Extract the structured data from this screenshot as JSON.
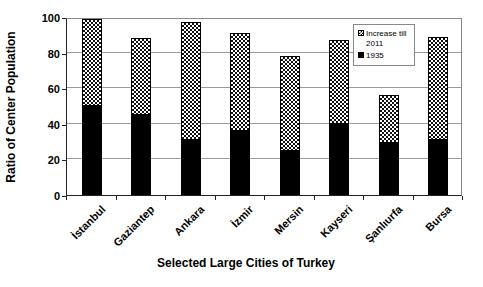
{
  "chart_data": {
    "type": "bar",
    "stacked": true,
    "title": "",
    "xlabel": "Selected Large Cities of Turkey",
    "ylabel": "Ratio of Center Population",
    "ylim": [
      0,
      100
    ],
    "yticks": [
      0,
      20,
      40,
      60,
      80,
      100
    ],
    "grid": true,
    "legend_position": "top-right-inside",
    "categories": [
      "İstanbul",
      "Gaziantep",
      "Ankara",
      "İzmir",
      "Mersin",
      "Kayseri",
      "Şanlıurfa",
      "Bursa"
    ],
    "series": [
      {
        "name": "1935",
        "pattern": "solid",
        "color": "#000000",
        "values": [
          50,
          45,
          31,
          36,
          25,
          40,
          29,
          31
        ]
      },
      {
        "name": "Increase till 2011",
        "pattern": "checker",
        "color": "#111111",
        "values": [
          49,
          43,
          66,
          55,
          53,
          47,
          27,
          58
        ]
      }
    ],
    "totals_2011": [
      99,
      88,
      97,
      91,
      78,
      87,
      56,
      89
    ]
  },
  "legend": {
    "items": [
      {
        "label": "Increase till 2011",
        "swatch": "checker"
      },
      {
        "label": "1935",
        "swatch": "black"
      }
    ]
  },
  "colors": {
    "bar_fill": "#000000",
    "gridline": "#9a9a9a",
    "axis": "#222222",
    "background": "#ffffff"
  }
}
